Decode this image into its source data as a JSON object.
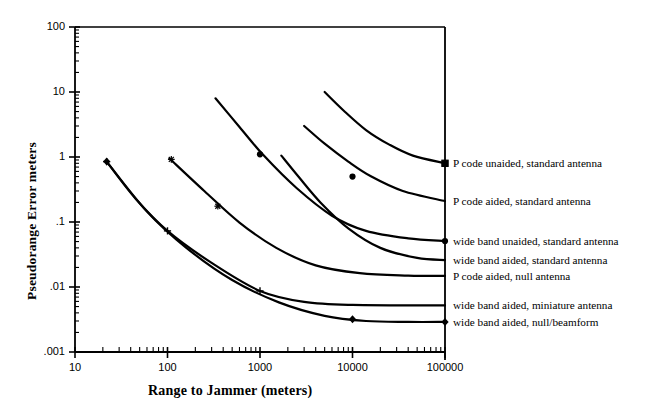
{
  "chart_data": {
    "type": "line",
    "title": "",
    "xlabel": "Range to Jammer (meters)",
    "ylabel": "Pseudorange Error meters",
    "xscale": "log",
    "yscale": "log",
    "xlim": [
      10,
      100000
    ],
    "ylim": [
      0.001,
      100
    ],
    "xticks": [
      "10",
      "100",
      "1000",
      "10000",
      "100000"
    ],
    "xtick_values": [
      10,
      100,
      1000,
      10000,
      100000
    ],
    "yticks": [
      "100",
      "10",
      "1",
      ".1",
      ".01",
      ".001"
    ],
    "ytick_values": [
      100,
      10,
      1,
      0.1,
      0.01,
      0.001
    ],
    "grid": false,
    "legend_position": "right-inline-at-curve-ends",
    "series": [
      {
        "name": "P code unaided, standard antenna",
        "marker": "square",
        "points": [
          {
            "x": 5000,
            "y": 10.0
          },
          {
            "x": 8000,
            "y": 5.2
          },
          {
            "x": 14000,
            "y": 2.6
          },
          {
            "x": 25000,
            "y": 1.55
          },
          {
            "x": 45000,
            "y": 1.05
          },
          {
            "x": 100000,
            "y": 0.8
          }
        ],
        "markers_at": [
          {
            "x": 100000,
            "y": 0.8
          }
        ]
      },
      {
        "name": "P code aided, standard  antenna",
        "marker": "dot",
        "points": [
          {
            "x": 3000,
            "y": 3.0
          },
          {
            "x": 5000,
            "y": 1.6
          },
          {
            "x": 9000,
            "y": 0.85
          },
          {
            "x": 16000,
            "y": 0.5
          },
          {
            "x": 35000,
            "y": 0.3
          },
          {
            "x": 100000,
            "y": 0.21
          }
        ],
        "markers_at": [
          {
            "x": 10000,
            "y": 0.5
          }
        ]
      },
      {
        "name": "wide band unaided, standard  antenna",
        "marker": "dot",
        "points": [
          {
            "x": 330,
            "y": 8.0
          },
          {
            "x": 600,
            "y": 2.9
          },
          {
            "x": 1100,
            "y": 1.05
          },
          {
            "x": 2500,
            "y": 0.33
          },
          {
            "x": 6000,
            "y": 0.125
          },
          {
            "x": 14000,
            "y": 0.073
          },
          {
            "x": 40000,
            "y": 0.056
          },
          {
            "x": 100000,
            "y": 0.051
          }
        ],
        "markers_at": [
          {
            "x": 1000,
            "y": 1.1
          },
          {
            "x": 100000,
            "y": 0.051
          }
        ]
      },
      {
        "name": "wide band aided, standard  antenna",
        "marker": "none",
        "points": [
          {
            "x": 1700,
            "y": 1.05
          },
          {
            "x": 2600,
            "y": 0.5
          },
          {
            "x": 4500,
            "y": 0.2
          },
          {
            "x": 9000,
            "y": 0.08
          },
          {
            "x": 20000,
            "y": 0.04
          },
          {
            "x": 50000,
            "y": 0.028
          },
          {
            "x": 100000,
            "y": 0.026
          }
        ],
        "markers_at": []
      },
      {
        "name": "P code aided, null antenna",
        "marker": "star",
        "points": [
          {
            "x": 105,
            "y": 0.95
          },
          {
            "x": 250,
            "y": 0.3
          },
          {
            "x": 600,
            "y": 0.098
          },
          {
            "x": 1500,
            "y": 0.04
          },
          {
            "x": 4000,
            "y": 0.0215
          },
          {
            "x": 12000,
            "y": 0.0163
          },
          {
            "x": 40000,
            "y": 0.015
          },
          {
            "x": 100000,
            "y": 0.0148
          }
        ],
        "markers_at": [
          {
            "x": 110,
            "y": 0.92
          },
          {
            "x": 350,
            "y": 0.175
          }
        ]
      },
      {
        "name": "wide band aided, miniature  antenna",
        "marker": "plus",
        "points": [
          {
            "x": 22,
            "y": 0.85
          },
          {
            "x": 45,
            "y": 0.23
          },
          {
            "x": 100,
            "y": 0.073
          },
          {
            "x": 300,
            "y": 0.0235
          },
          {
            "x": 1000,
            "y": 0.0087
          },
          {
            "x": 3000,
            "y": 0.0059
          },
          {
            "x": 10000,
            "y": 0.0053
          },
          {
            "x": 100000,
            "y": 0.0052
          }
        ],
        "markers_at": [
          {
            "x": 22,
            "y": 0.85
          },
          {
            "x": 100,
            "y": 0.073
          },
          {
            "x": 1000,
            "y": 0.0087
          }
        ]
      },
      {
        "name": "wide band aided, null/beamform",
        "marker": "diamond",
        "points": [
          {
            "x": 22,
            "y": 0.85
          },
          {
            "x": 60,
            "y": 0.145
          },
          {
            "x": 160,
            "y": 0.04
          },
          {
            "x": 500,
            "y": 0.0128
          },
          {
            "x": 1600,
            "y": 0.0058
          },
          {
            "x": 5000,
            "y": 0.0036
          },
          {
            "x": 14000,
            "y": 0.003
          },
          {
            "x": 40000,
            "y": 0.0029
          },
          {
            "x": 100000,
            "y": 0.0029
          }
        ],
        "markers_at": [
          {
            "x": 22,
            "y": 0.85
          },
          {
            "x": 10000,
            "y": 0.0032
          },
          {
            "x": 100000,
            "y": 0.0029
          }
        ]
      }
    ],
    "legend_entries": [
      {
        "label": "P code unaided, standard  antenna",
        "y_value": 0.8
      },
      {
        "label": "P code aided, standard  antenna",
        "y_value": 0.21
      },
      {
        "label": "wide band unaided, standard  antenna",
        "y_value": 0.051
      },
      {
        "label": "wide band aided, standard  antenna",
        "y_value": 0.026
      },
      {
        "label": "P code aided, null antenna",
        "y_value": 0.0148
      },
      {
        "label": "wide band aided, miniature  antenna",
        "y_value": 0.0052
      },
      {
        "label": "wide band aided, null/beamform",
        "y_value": 0.0029
      }
    ]
  }
}
